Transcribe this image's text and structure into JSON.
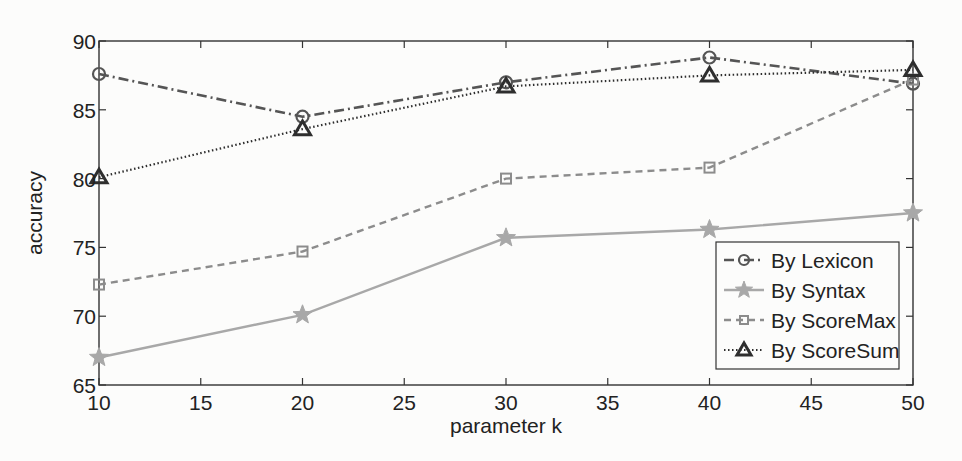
{
  "chart_data": {
    "type": "line",
    "title": "",
    "xlabel": "parameter k",
    "ylabel": "accuracy",
    "x": [
      10,
      20,
      30,
      40,
      50
    ],
    "xlim": [
      10,
      50
    ],
    "ylim": [
      65,
      90
    ],
    "xticks": [
      10,
      15,
      20,
      25,
      30,
      35,
      40,
      45,
      50
    ],
    "yticks": [
      65,
      70,
      75,
      80,
      85,
      90
    ],
    "grid": false,
    "legend_position": "lower right",
    "series": [
      {
        "name": "By Lexicon",
        "values": [
          87.6,
          84.5,
          87.0,
          88.8,
          86.9
        ],
        "color": "#555555",
        "dash": "10,4,2,4",
        "marker": "circle",
        "width": 2.6
      },
      {
        "name": "By Syntax",
        "values": [
          67.0,
          70.1,
          75.7,
          76.3,
          77.5
        ],
        "color": "#a8a8a8",
        "dash": "",
        "marker": "star",
        "width": 2.4
      },
      {
        "name": "By ScoreMax",
        "values": [
          72.3,
          74.7,
          80.0,
          80.8,
          87.2
        ],
        "color": "#8c8c8c",
        "dash": "7,5",
        "marker": "square",
        "width": 2.4
      },
      {
        "name": "By ScoreSum",
        "values": [
          80.1,
          83.6,
          86.7,
          87.5,
          87.9
        ],
        "color": "#2e2e2e",
        "dash": "1.5,2.5",
        "marker": "triangle",
        "width": 2.2
      }
    ]
  }
}
